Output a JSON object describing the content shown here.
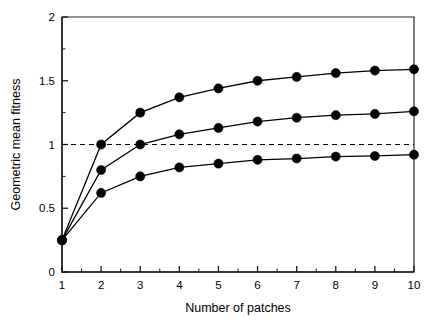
{
  "chart_data": {
    "type": "line",
    "title": "",
    "subtitle": "",
    "xlabel": "Number of patches",
    "ylabel": "Geometric mean fitness",
    "xlim": [
      1,
      10
    ],
    "ylim": [
      0,
      2
    ],
    "grid": false,
    "legend_position": "none",
    "x": [
      1,
      2,
      3,
      4,
      5,
      6,
      7,
      8,
      9,
      10
    ],
    "xticks": [
      1,
      2,
      3,
      4,
      5,
      6,
      7,
      8,
      9,
      10
    ],
    "xticklabels": [
      "1",
      "2",
      "3",
      "4",
      "5",
      "6",
      "7",
      "8",
      "9",
      "10"
    ],
    "xminorticks": [
      1.5,
      2.5,
      3.5,
      4.5,
      5.5,
      6.5,
      7.5,
      8.5,
      9.5
    ],
    "yticks": [
      0,
      0.5,
      1,
      1.5,
      2
    ],
    "yticklabels": [
      "0",
      "0.5",
      "1",
      "1.5",
      "2"
    ],
    "yminorticks": [
      0.25,
      0.75,
      1.25,
      1.75
    ],
    "annotations": [
      {
        "name": "reference-line",
        "type": "hline",
        "value": 1,
        "style": "dashed"
      }
    ],
    "series": [
      {
        "name": "upper",
        "marker": "filled-circle",
        "color": "#000000",
        "values": [
          0.25,
          1.0,
          1.25,
          1.37,
          1.44,
          1.5,
          1.53,
          1.56,
          1.58,
          1.59
        ]
      },
      {
        "name": "middle",
        "marker": "filled-circle",
        "color": "#000000",
        "values": [
          0.25,
          0.8,
          1.0,
          1.08,
          1.13,
          1.18,
          1.21,
          1.23,
          1.24,
          1.26
        ]
      },
      {
        "name": "lower",
        "marker": "filled-circle",
        "color": "#000000",
        "values": [
          0.25,
          0.62,
          0.75,
          0.82,
          0.85,
          0.88,
          0.89,
          0.905,
          0.91,
          0.92
        ]
      }
    ]
  },
  "figure": {
    "background_color": "#ffffff",
    "axis_color": "#1a1a1a",
    "marker_color": "#000000"
  }
}
